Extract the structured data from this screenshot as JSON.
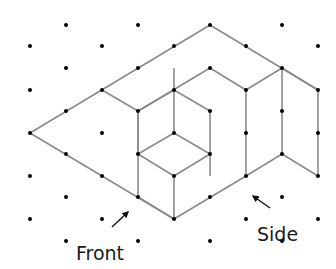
{
  "figure": {
    "type": "isometric-dot-grid-drawing",
    "partial_label": ")",
    "labels": {
      "front": "Front",
      "side": "Side"
    },
    "colors": {
      "dot": "#000000",
      "edge": "#8a8a8a",
      "text": "#1a1a1a",
      "arrow": "#111111"
    },
    "grid": {
      "columns_x": [
        30,
        66,
        102,
        138,
        174,
        210,
        246,
        282,
        318
      ],
      "row_step": 21.6,
      "first_row_y": 25
    },
    "dots": [
      [
        66,
        25
      ],
      [
        138,
        25
      ],
      [
        210,
        25
      ],
      [
        282,
        25
      ],
      [
        30,
        46
      ],
      [
        102,
        46
      ],
      [
        174,
        46
      ],
      [
        246,
        46
      ],
      [
        318,
        46
      ],
      [
        66,
        68
      ],
      [
        138,
        68
      ],
      [
        210,
        68
      ],
      [
        282,
        68
      ],
      [
        30,
        90
      ],
      [
        102,
        90
      ],
      [
        174,
        90
      ],
      [
        246,
        90
      ],
      [
        318,
        90
      ],
      [
        66,
        111
      ],
      [
        138,
        111
      ],
      [
        210,
        111
      ],
      [
        282,
        111
      ],
      [
        30,
        133
      ],
      [
        102,
        133
      ],
      [
        174,
        133
      ],
      [
        246,
        133
      ],
      [
        318,
        133
      ],
      [
        66,
        154
      ],
      [
        138,
        154
      ],
      [
        210,
        154
      ],
      [
        282,
        154
      ],
      [
        30,
        176
      ],
      [
        102,
        176
      ],
      [
        174,
        176
      ],
      [
        246,
        176
      ],
      [
        318,
        176
      ],
      [
        66,
        197
      ],
      [
        138,
        197
      ],
      [
        210,
        197
      ],
      [
        282,
        197
      ],
      [
        30,
        219
      ],
      [
        102,
        219
      ],
      [
        174,
        219
      ],
      [
        246,
        219
      ],
      [
        318,
        219
      ],
      [
        66,
        241
      ],
      [
        138,
        241
      ],
      [
        210,
        241
      ],
      [
        282,
        241
      ]
    ],
    "edges": [
      [
        [
          30,
          133
        ],
        [
          210,
          25
        ]
      ],
      [
        [
          210,
          25
        ],
        [
          318,
          90
        ]
      ],
      [
        [
          30,
          133
        ],
        [
          174,
          219
        ]
      ],
      [
        [
          102,
          90
        ],
        [
          138,
          111
        ]
      ],
      [
        [
          138,
          111
        ],
        [
          138,
          197
        ]
      ],
      [
        [
          138,
          111
        ],
        [
          210,
          68
        ]
      ],
      [
        [
          210,
          68
        ],
        [
          246,
          90
        ]
      ],
      [
        [
          246,
          90
        ],
        [
          282,
          68
        ]
      ],
      [
        [
          282,
          68
        ],
        [
          318,
          90
        ]
      ],
      [
        [
          246,
          90
        ],
        [
          246,
          176
        ]
      ],
      [
        [
          282,
          68
        ],
        [
          282,
          154
        ]
      ],
      [
        [
          318,
          90
        ],
        [
          318,
          176
        ]
      ],
      [
        [
          282,
          154
        ],
        [
          318,
          176
        ]
      ],
      [
        [
          246,
          176
        ],
        [
          282,
          154
        ]
      ],
      [
        [
          138,
          197
        ],
        [
          174,
          219
        ]
      ],
      [
        [
          174,
          219
        ],
        [
          246,
          176
        ]
      ],
      [
        [
          174,
          68
        ],
        [
          174,
          133
        ]
      ],
      [
        [
          138,
          111
        ],
        [
          174,
          90
        ]
      ],
      [
        [
          174,
          90
        ],
        [
          210,
          111
        ]
      ],
      [
        [
          210,
          111
        ],
        [
          210,
          176
        ]
      ],
      [
        [
          174,
          133
        ],
        [
          138,
          154
        ]
      ],
      [
        [
          174,
          133
        ],
        [
          210,
          154
        ]
      ],
      [
        [
          138,
          154
        ],
        [
          174,
          176
        ]
      ],
      [
        [
          174,
          176
        ],
        [
          210,
          154
        ]
      ],
      [
        [
          174,
          176
        ],
        [
          174,
          219
        ]
      ],
      [
        [
          138,
          154
        ],
        [
          138,
          111
        ]
      ]
    ],
    "arrows": {
      "front": {
        "from": [
          112,
          227
        ],
        "to": [
          128,
          212
        ]
      },
      "side": {
        "from": [
          270,
          208
        ],
        "to": [
          253,
          196
        ]
      }
    }
  }
}
